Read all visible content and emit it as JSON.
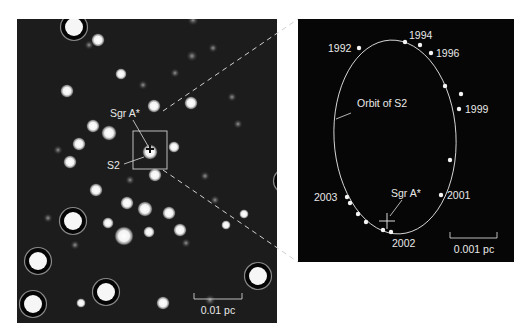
{
  "colors": {
    "page_bg": "#ffffff",
    "field_bg": "#1c1c1c",
    "orbit_bg": "#060606",
    "star": "#f2f2f2",
    "line": "#d8d8d8"
  },
  "left_panel": {
    "x": 17,
    "y": 19,
    "w": 260,
    "h": 304,
    "labels": {
      "sgr_a": "Sgr A*",
      "s2": "S2",
      "scale": "0.01 pc"
    },
    "zoom_box": {
      "x": 133,
      "y": 131,
      "w": 34,
      "h": 38
    },
    "sgr_marker": {
      "x": 150,
      "y": 149
    },
    "scale_bar": {
      "x1": 194,
      "x2": 242,
      "y": 299,
      "label_x": 218,
      "label_y": 314
    },
    "stars": [
      [
        74,
        27,
        9,
        1
      ],
      [
        98,
        40,
        7,
        0
      ],
      [
        121,
        74,
        6,
        0
      ],
      [
        67,
        91,
        7,
        0
      ],
      [
        154,
        106,
        7,
        0
      ],
      [
        191,
        103,
        7,
        0
      ],
      [
        93,
        126,
        7,
        0
      ],
      [
        109,
        133,
        8,
        0
      ],
      [
        79,
        144,
        7,
        0
      ],
      [
        70,
        162,
        7,
        0
      ],
      [
        150,
        152,
        8,
        0
      ],
      [
        174,
        147,
        6,
        0
      ],
      [
        155,
        175,
        7,
        0
      ],
      [
        96,
        190,
        7,
        0
      ],
      [
        127,
        203,
        7,
        0
      ],
      [
        145,
        209,
        8,
        0
      ],
      [
        169,
        213,
        7,
        0
      ],
      [
        73,
        221,
        9,
        1
      ],
      [
        108,
        223,
        6,
        0
      ],
      [
        124,
        236,
        10,
        0
      ],
      [
        149,
        232,
        6,
        0
      ],
      [
        180,
        230,
        7,
        0
      ],
      [
        226,
        225,
        5,
        0
      ],
      [
        244,
        214,
        5,
        0
      ],
      [
        286,
        181,
        8,
        1
      ],
      [
        250,
        273,
        6,
        0
      ],
      [
        258,
        276,
        9,
        1
      ],
      [
        38,
        261,
        9,
        1
      ],
      [
        106,
        292,
        9,
        1
      ],
      [
        33,
        304,
        9,
        1
      ],
      [
        163,
        303,
        7,
        0
      ],
      [
        81,
        303,
        5,
        0
      ],
      [
        238,
        124,
        3,
        0
      ],
      [
        192,
        56,
        4,
        0
      ],
      [
        193,
        20,
        4,
        0
      ],
      [
        213,
        48,
        3,
        0
      ],
      [
        89,
        45,
        3,
        0
      ],
      [
        143,
        85,
        3,
        0
      ],
      [
        175,
        73,
        3,
        0
      ],
      [
        232,
        97,
        3,
        0
      ],
      [
        58,
        150,
        3,
        0
      ],
      [
        205,
        176,
        3,
        0
      ],
      [
        186,
        243,
        3,
        0
      ],
      [
        75,
        245,
        3,
        0
      ],
      [
        210,
        300,
        4,
        0
      ],
      [
        48,
        218,
        3,
        0
      ],
      [
        215,
        200,
        3,
        0
      ],
      [
        130,
        180,
        3,
        0
      ]
    ]
  },
  "connector_lines": [
    {
      "x1": 163,
      "y1": 111,
      "x2": 298,
      "y2": 19
    },
    {
      "x1": 163,
      "y1": 170,
      "x2": 298,
      "y2": 262
    }
  ],
  "right_panel": {
    "x": 298,
    "y": 19,
    "w": 216,
    "h": 243,
    "labels": {
      "orbit": "Orbit of S2",
      "sgr_a": "Sgr A*",
      "scale": "0.001 pc"
    },
    "orbit_ellipse": {
      "cx": 395,
      "cy": 137,
      "rx": 61,
      "ry": 97,
      "rotate": -3
    },
    "sgr_marker": {
      "x": 387,
      "y": 221,
      "size": 8
    },
    "scale_bar": {
      "x1": 450,
      "x2": 497,
      "y": 257,
      "label_x": 474,
      "label_y": 253
    },
    "orbit_points": [
      {
        "x": 359,
        "y": 48,
        "year": "1992"
      },
      {
        "x": 405,
        "y": 42,
        "year": "1994"
      },
      {
        "x": 420,
        "y": 45,
        "year": ""
      },
      {
        "x": 431,
        "y": 53,
        "year": "1996"
      },
      {
        "x": 445,
        "y": 86,
        "year": ""
      },
      {
        "x": 461,
        "y": 94,
        "year": ""
      },
      {
        "x": 459,
        "y": 109,
        "year": "1999"
      },
      {
        "x": 450,
        "y": 160,
        "year": ""
      },
      {
        "x": 441,
        "y": 195,
        "year": "2001"
      },
      {
        "x": 391,
        "y": 232,
        "year": "2002"
      },
      {
        "x": 383,
        "y": 230,
        "year": ""
      },
      {
        "x": 366,
        "y": 222,
        "year": ""
      },
      {
        "x": 358,
        "y": 214,
        "year": ""
      },
      {
        "x": 350,
        "y": 203,
        "year": ""
      },
      {
        "x": 347,
        "y": 197,
        "year": "2003"
      }
    ],
    "year_labels": [
      {
        "text": "1992",
        "x": 328,
        "y": 52
      },
      {
        "text": "1994",
        "x": 409,
        "y": 39
      },
      {
        "text": "1996",
        "x": 436,
        "y": 57
      },
      {
        "text": "1999",
        "x": 465,
        "y": 113
      },
      {
        "text": "2001",
        "x": 447,
        "y": 199
      },
      {
        "text": "2002",
        "x": 392,
        "y": 247
      },
      {
        "text": "2003",
        "x": 314,
        "y": 201
      }
    ]
  }
}
